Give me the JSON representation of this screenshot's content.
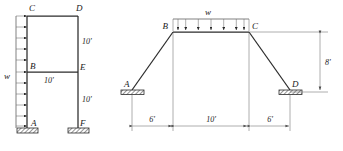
{
  "figure": {
    "background_color": "#ffffff",
    "line_color": "#2b2b2b",
    "width": 343,
    "height": 151
  },
  "left_frame": {
    "name": "two-story-frame-with-lateral-distributed-load",
    "joint_labels": {
      "C": "C",
      "D": "D",
      "B": "B",
      "E": "E",
      "A": "A",
      "F": "F"
    },
    "load_label": "w",
    "load_arrow_count": 11,
    "load_direction": "horizontal-right",
    "dimensions": [
      {
        "id": "upper-story-height",
        "text": "10'"
      },
      {
        "id": "span-BE",
        "text": "10'"
      },
      {
        "id": "lower-story-height",
        "text": "10'"
      }
    ],
    "supports": [
      {
        "id": "support-A",
        "type": "fixed"
      },
      {
        "id": "support-F",
        "type": "fixed"
      }
    ]
  },
  "right_frame": {
    "name": "gable-frame-with-vertical-distributed-load",
    "joint_labels": {
      "A": "A",
      "B": "B",
      "C": "C",
      "D": "D"
    },
    "load_label": "w",
    "load_arrow_count": 6,
    "load_direction": "vertical-down",
    "dimensions": [
      {
        "id": "left-horizontal-offset",
        "text": "6'"
      },
      {
        "id": "center-span-BC",
        "text": "10'"
      },
      {
        "id": "right-horizontal-offset",
        "text": "6'"
      },
      {
        "id": "vertical-rise",
        "text": "8'"
      }
    ],
    "supports": [
      {
        "id": "support-A",
        "type": "pinned-hatched"
      },
      {
        "id": "support-D",
        "type": "pinned-hatched"
      }
    ]
  }
}
